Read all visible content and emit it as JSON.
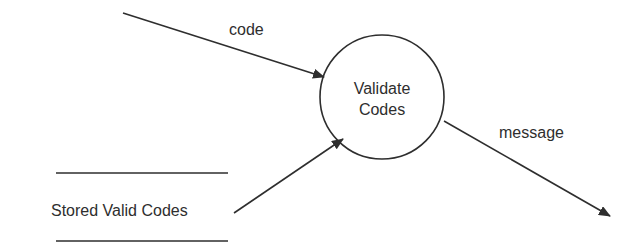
{
  "diagram": {
    "type": "data-flow-diagram",
    "process": {
      "label_line1": "Validate",
      "label_line2": "Codes"
    },
    "data_store": {
      "label": "Stored Valid Codes"
    },
    "flows": [
      {
        "label": "code",
        "from": "external",
        "to": "Validate Codes"
      },
      {
        "label": "",
        "from": "Stored Valid Codes",
        "to": "Validate Codes"
      },
      {
        "label": "message",
        "from": "Validate Codes",
        "to": "external"
      }
    ],
    "colors": {
      "stroke": "#2e2e2e",
      "background": "#ffffff"
    }
  }
}
